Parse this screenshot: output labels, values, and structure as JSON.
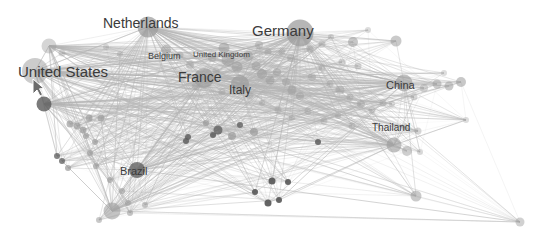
{
  "visualization": {
    "type": "force-directed-network-graph",
    "title": "",
    "background_color": "#ffffff",
    "node_color": "#9a9a9a",
    "node_color_dark": "#5a5a5a",
    "edge_color": "#b4b4b4",
    "label_color": "#3b3b3b",
    "width": 548,
    "height": 241
  },
  "chart_data": {
    "type": "scatter",
    "title": "",
    "xlabel": "",
    "ylabel": "",
    "grid": false,
    "legend": null,
    "labeled_nodes": [
      {
        "label": "Germany",
        "x": 300,
        "y": 33,
        "r": 13.5,
        "font_size": 15,
        "label_x": 252,
        "label_y": 23,
        "opacity": 0.62,
        "dark": false
      },
      {
        "label": "United States",
        "x": 35,
        "y": 71,
        "r": 13.0,
        "font_size": 15,
        "label_x": 18,
        "label_y": 64,
        "opacity": 0.42,
        "dark": false
      },
      {
        "label": "Netherlands",
        "x": 148,
        "y": 27,
        "r": 10.5,
        "font_size": 14,
        "label_x": 103,
        "label_y": 16,
        "opacity": 0.6,
        "dark": false
      },
      {
        "label": "France",
        "x": 204,
        "y": 78,
        "r": 10.0,
        "font_size": 14,
        "label_x": 178,
        "label_y": 70,
        "opacity": 0.55,
        "dark": false
      },
      {
        "label": "Italy",
        "x": 240,
        "y": 84,
        "r": 9.0,
        "font_size": 12,
        "label_x": 229,
        "label_y": 84,
        "opacity": 0.52,
        "dark": false
      },
      {
        "label": "China",
        "x": 404,
        "y": 83,
        "r": 8.5,
        "font_size": 11,
        "label_x": 386,
        "label_y": 80,
        "opacity": 0.5,
        "dark": false
      },
      {
        "label": "Thailand",
        "x": 394,
        "y": 145,
        "r": 7.5,
        "font_size": 10,
        "label_x": 372,
        "label_y": 123,
        "opacity": 0.48,
        "dark": false
      },
      {
        "label": "Brazil",
        "x": 137,
        "y": 170,
        "r": 8.0,
        "font_size": 11,
        "label_x": 120,
        "label_y": 166,
        "opacity": 0.6,
        "dark": true
      },
      {
        "label": "Belgium",
        "x": 166,
        "y": 50,
        "r": 5.0,
        "font_size": 9,
        "label_x": 148,
        "label_y": 52,
        "opacity": 0.45,
        "dark": false
      },
      {
        "label": "United Kingdom",
        "x": 224,
        "y": 48,
        "r": 5.5,
        "font_size": 8,
        "label_x": 193,
        "label_y": 51,
        "opacity": 0.45,
        "dark": false
      }
    ],
    "nodes": [
      {
        "x": 35,
        "y": 71,
        "r": 13.0,
        "o": 0.38
      },
      {
        "x": 49,
        "y": 46,
        "r": 7.5,
        "o": 0.3
      },
      {
        "x": 44,
        "y": 104,
        "r": 7.5,
        "o": 0.68
      },
      {
        "x": 148,
        "y": 27,
        "r": 10.5,
        "o": 0.58
      },
      {
        "x": 300,
        "y": 33,
        "r": 13.5,
        "o": 0.6
      },
      {
        "x": 204,
        "y": 78,
        "r": 10.0,
        "o": 0.52
      },
      {
        "x": 240,
        "y": 84,
        "r": 9.0,
        "o": 0.5
      },
      {
        "x": 404,
        "y": 83,
        "r": 8.5,
        "o": 0.48
      },
      {
        "x": 394,
        "y": 145,
        "r": 7.5,
        "o": 0.46
      },
      {
        "x": 137,
        "y": 170,
        "r": 8.0,
        "o": 0.62
      },
      {
        "x": 112,
        "y": 211,
        "r": 8.5,
        "o": 0.45
      },
      {
        "x": 166,
        "y": 50,
        "r": 5.0,
        "o": 0.42
      },
      {
        "x": 224,
        "y": 48,
        "r": 5.5,
        "o": 0.42
      },
      {
        "x": 228,
        "y": 60,
        "r": 6.5,
        "o": 0.4
      },
      {
        "x": 237,
        "y": 67,
        "r": 5.5,
        "o": 0.4
      },
      {
        "x": 248,
        "y": 56,
        "r": 5.0,
        "o": 0.38
      },
      {
        "x": 256,
        "y": 66,
        "r": 4.5,
        "o": 0.38
      },
      {
        "x": 262,
        "y": 74,
        "r": 5.0,
        "o": 0.42
      },
      {
        "x": 270,
        "y": 80,
        "r": 4.5,
        "o": 0.4
      },
      {
        "x": 277,
        "y": 72,
        "r": 4.0,
        "o": 0.36
      },
      {
        "x": 286,
        "y": 82,
        "r": 4.0,
        "o": 0.36
      },
      {
        "x": 292,
        "y": 90,
        "r": 4.5,
        "o": 0.38
      },
      {
        "x": 300,
        "y": 96,
        "r": 4.0,
        "o": 0.34
      },
      {
        "x": 259,
        "y": 45,
        "r": 4.0,
        "o": 0.32
      },
      {
        "x": 268,
        "y": 52,
        "r": 3.5,
        "o": 0.3
      },
      {
        "x": 282,
        "y": 52,
        "r": 3.5,
        "o": 0.3
      },
      {
        "x": 291,
        "y": 58,
        "r": 4.0,
        "o": 0.32
      },
      {
        "x": 310,
        "y": 49,
        "r": 3.5,
        "o": 0.3
      },
      {
        "x": 322,
        "y": 44,
        "r": 3.5,
        "o": 0.28
      },
      {
        "x": 331,
        "y": 37,
        "r": 3.0,
        "o": 0.26
      },
      {
        "x": 353,
        "y": 42,
        "r": 5.0,
        "o": 0.42
      },
      {
        "x": 396,
        "y": 41,
        "r": 5.5,
        "o": 0.4
      },
      {
        "x": 342,
        "y": 62,
        "r": 3.5,
        "o": 0.3
      },
      {
        "x": 358,
        "y": 66,
        "r": 3.5,
        "o": 0.3
      },
      {
        "x": 322,
        "y": 68,
        "r": 3.5,
        "o": 0.28
      },
      {
        "x": 312,
        "y": 77,
        "r": 4.0,
        "o": 0.3
      },
      {
        "x": 330,
        "y": 84,
        "r": 3.5,
        "o": 0.28
      },
      {
        "x": 340,
        "y": 90,
        "r": 4.5,
        "o": 0.34
      },
      {
        "x": 350,
        "y": 97,
        "r": 3.5,
        "o": 0.3
      },
      {
        "x": 361,
        "y": 104,
        "r": 4.0,
        "o": 0.32
      },
      {
        "x": 372,
        "y": 110,
        "r": 3.5,
        "o": 0.3
      },
      {
        "x": 383,
        "y": 103,
        "r": 3.5,
        "o": 0.28
      },
      {
        "x": 414,
        "y": 97,
        "r": 3.5,
        "o": 0.28
      },
      {
        "x": 424,
        "y": 88,
        "r": 4.0,
        "o": 0.3
      },
      {
        "x": 437,
        "y": 84,
        "r": 4.5,
        "o": 0.38
      },
      {
        "x": 449,
        "y": 86,
        "r": 4.5,
        "o": 0.4
      },
      {
        "x": 461,
        "y": 82,
        "r": 5.0,
        "o": 0.42
      },
      {
        "x": 405,
        "y": 127,
        "r": 3.5,
        "o": 0.26
      },
      {
        "x": 407,
        "y": 151,
        "r": 5.0,
        "o": 0.36
      },
      {
        "x": 418,
        "y": 131,
        "r": 3.5,
        "o": 0.28
      },
      {
        "x": 420,
        "y": 152,
        "r": 3.0,
        "o": 0.26
      },
      {
        "x": 416,
        "y": 196,
        "r": 5.5,
        "o": 0.4
      },
      {
        "x": 520,
        "y": 222,
        "r": 4.5,
        "o": 0.34
      },
      {
        "x": 392,
        "y": 104,
        "r": 3.0,
        "o": 0.24
      },
      {
        "x": 190,
        "y": 65,
        "r": 4.0,
        "o": 0.32
      },
      {
        "x": 180,
        "y": 55,
        "r": 3.5,
        "o": 0.3
      },
      {
        "x": 212,
        "y": 58,
        "r": 4.0,
        "o": 0.32
      },
      {
        "x": 216,
        "y": 71,
        "r": 3.5,
        "o": 0.3
      },
      {
        "x": 196,
        "y": 86,
        "r": 4.0,
        "o": 0.3
      },
      {
        "x": 222,
        "y": 92,
        "r": 3.5,
        "o": 0.28
      },
      {
        "x": 250,
        "y": 96,
        "r": 3.5,
        "o": 0.28
      },
      {
        "x": 262,
        "y": 103,
        "r": 3.0,
        "o": 0.26
      },
      {
        "x": 278,
        "y": 110,
        "r": 3.5,
        "o": 0.28
      },
      {
        "x": 292,
        "y": 118,
        "r": 3.0,
        "o": 0.26
      },
      {
        "x": 308,
        "y": 111,
        "r": 3.5,
        "o": 0.28
      },
      {
        "x": 324,
        "y": 121,
        "r": 3.5,
        "o": 0.28
      },
      {
        "x": 338,
        "y": 116,
        "r": 3.0,
        "o": 0.26
      },
      {
        "x": 352,
        "y": 126,
        "r": 3.5,
        "o": 0.28
      },
      {
        "x": 218,
        "y": 130,
        "r": 4.5,
        "o": 0.62
      },
      {
        "x": 232,
        "y": 136,
        "r": 4.0,
        "o": 0.58
      },
      {
        "x": 254,
        "y": 132,
        "r": 4.0,
        "o": 0.58
      },
      {
        "x": 89,
        "y": 118,
        "r": 3.5,
        "o": 0.58
      },
      {
        "x": 101,
        "y": 118,
        "r": 3.5,
        "o": 0.58
      },
      {
        "x": 70,
        "y": 124,
        "r": 3.5,
        "o": 0.56
      },
      {
        "x": 77,
        "y": 126,
        "r": 3.5,
        "o": 0.56
      },
      {
        "x": 83,
        "y": 130,
        "r": 3.5,
        "o": 0.56
      },
      {
        "x": 86,
        "y": 136,
        "r": 3.0,
        "o": 0.54
      },
      {
        "x": 95,
        "y": 142,
        "r": 3.0,
        "o": 0.54
      },
      {
        "x": 90,
        "y": 153,
        "r": 3.0,
        "o": 0.52
      },
      {
        "x": 96,
        "y": 166,
        "r": 3.0,
        "o": 0.52
      },
      {
        "x": 110,
        "y": 180,
        "r": 3.0,
        "o": 0.5
      },
      {
        "x": 122,
        "y": 191,
        "r": 3.0,
        "o": 0.48
      },
      {
        "x": 128,
        "y": 203,
        "r": 3.0,
        "o": 0.46
      },
      {
        "x": 99,
        "y": 220,
        "r": 3.0,
        "o": 0.42
      },
      {
        "x": 130,
        "y": 213,
        "r": 3.0,
        "o": 0.44
      },
      {
        "x": 145,
        "y": 205,
        "r": 3.0,
        "o": 0.4
      },
      {
        "x": 272,
        "y": 181,
        "r": 3.5,
        "o": 0.82
      },
      {
        "x": 288,
        "y": 182,
        "r": 3.0,
        "o": 0.8
      },
      {
        "x": 255,
        "y": 192,
        "r": 3.0,
        "o": 0.8
      },
      {
        "x": 279,
        "y": 200,
        "r": 3.0,
        "o": 0.8
      },
      {
        "x": 268,
        "y": 203,
        "r": 3.5,
        "o": 0.82
      },
      {
        "x": 213,
        "y": 135,
        "r": 3.0,
        "o": 0.72
      },
      {
        "x": 318,
        "y": 142,
        "r": 3.0,
        "o": 0.72
      },
      {
        "x": 186,
        "y": 141,
        "r": 3.0,
        "o": 0.68
      },
      {
        "x": 188,
        "y": 137,
        "r": 3.0,
        "o": 0.68
      },
      {
        "x": 240,
        "y": 125,
        "r": 3.0,
        "o": 0.62
      },
      {
        "x": 206,
        "y": 123,
        "r": 3.0,
        "o": 0.6
      },
      {
        "x": 57,
        "y": 156,
        "r": 3.0,
        "o": 0.62
      },
      {
        "x": 62,
        "y": 161,
        "r": 3.0,
        "o": 0.62
      },
      {
        "x": 68,
        "y": 168,
        "r": 3.0,
        "o": 0.6
      },
      {
        "x": 120,
        "y": 54,
        "r": 3.0,
        "o": 0.26
      },
      {
        "x": 106,
        "y": 47,
        "r": 3.0,
        "o": 0.24
      },
      {
        "x": 62,
        "y": 53,
        "r": 3.5,
        "o": 0.28
      },
      {
        "x": 466,
        "y": 120,
        "r": 3.0,
        "o": 0.22
      },
      {
        "x": 444,
        "y": 73,
        "r": 3.0,
        "o": 0.22
      },
      {
        "x": 368,
        "y": 30,
        "r": 3.0,
        "o": 0.22
      }
    ],
    "edges_note": "dense many-to-many hub-and-spoke connections radiating from Germany, Netherlands, United States, France, China, Brazil"
  },
  "cursor": {
    "icon": "mouse-pointer-arrow",
    "x": 33,
    "y": 79
  }
}
